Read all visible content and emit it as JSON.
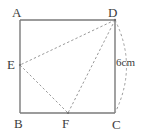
{
  "figure": {
    "shape_type": "geometry-diagram",
    "background_color": "#ffffff",
    "outline_color": "#7a7a7a",
    "construction_color": "#9a9a9a",
    "label_color": "#3d3d3d",
    "labels": {
      "A": "A",
      "B": "B",
      "C": "C",
      "D": "D",
      "E": "E",
      "F": "F",
      "measure_dc": "6cm"
    },
    "points": {
      "A": {
        "x": 20,
        "y": 20
      },
      "B": {
        "x": 20,
        "y": 113
      },
      "C": {
        "x": 115,
        "y": 113
      },
      "D": {
        "x": 115,
        "y": 20
      },
      "E": {
        "x": 20,
        "y": 65
      },
      "F": {
        "x": 68,
        "y": 113
      }
    },
    "solid_edges": [
      {
        "name": "AD",
        "from": "A",
        "to": "D"
      },
      {
        "name": "AB",
        "from": "A",
        "to": "B"
      },
      {
        "name": "BC",
        "from": "B",
        "to": "C"
      },
      {
        "name": "DC",
        "from": "D",
        "to": "C"
      }
    ],
    "dashed_segments": [
      {
        "name": "DE",
        "from": "D",
        "to": "E"
      },
      {
        "name": "DF",
        "from": "D",
        "to": "F"
      },
      {
        "name": "EF",
        "from": "E",
        "to": "F"
      }
    ],
    "dimension_arc": {
      "name": "arc-D-to-C",
      "from": "D",
      "to": "C",
      "bulge_direction": "right",
      "label": "6cm"
    }
  }
}
